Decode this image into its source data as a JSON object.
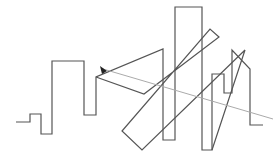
{
  "canvas": {
    "width": 273,
    "height": 158,
    "background": "#ffffff"
  },
  "colors": {
    "stroke": "#555555",
    "pointer_line": "#aaaaaa",
    "pointer_head": "#222222"
  },
  "shapes": {
    "skyline_path": "16,122 30,122 30,114 41,114 41,134 52,134 52,61 84,61 84,115 96,115 96,77 163,49 163,140 175,140 175,7 202,7 202,150 212,150 212,74 224,74 224,93 232,93 232,50 250,69 250,125 263,125",
    "triangle_path": "96,77 144,94 219,37 210,29 122,131 142,150 245,50 212,150",
    "pointer_line": {
      "x1": 103,
      "y1": 69,
      "x2": 273,
      "y2": 119
    },
    "pointer_head": "100,66 107,71 102,74"
  }
}
